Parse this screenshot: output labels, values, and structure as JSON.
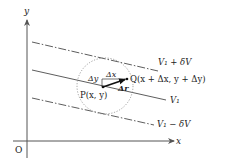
{
  "diagram": {
    "axes": {
      "x_label": "x",
      "y_label": "y",
      "origin_label": "O"
    },
    "lines": [
      {
        "id": "upper",
        "label": "V₁ + δV",
        "style": "dash-dot"
      },
      {
        "id": "middle",
        "label": "V₁",
        "style": "solid"
      },
      {
        "id": "lower",
        "label": "V₁ − δV",
        "style": "dash-dot"
      }
    ],
    "points": {
      "P": "P(x, y)",
      "Q": "Q(x + Δx, y + Δy)"
    },
    "increments": {
      "dx": "Δx",
      "dy": "Δy",
      "dr": "Δr"
    },
    "colors": {
      "ink": "#222222",
      "axis": "#555555",
      "circle": "#888888"
    }
  }
}
